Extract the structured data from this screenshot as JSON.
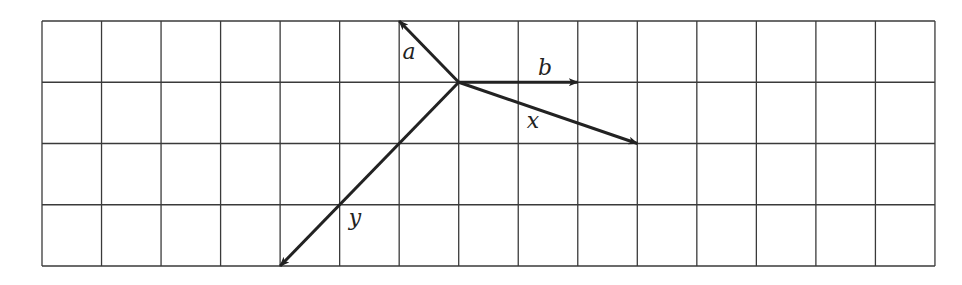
{
  "grid": {
    "cols": 15,
    "rows": 4,
    "left": 42,
    "top": 21,
    "cell_w": 59.53,
    "cell_h": 61.25,
    "line_color": "#3a3a3a"
  },
  "origin": {
    "col": 7,
    "row": 1
  },
  "vectors": [
    {
      "name": "a",
      "label": "a",
      "dx": -1,
      "dy": -1,
      "label_pos": [
        409,
        59
      ]
    },
    {
      "name": "b",
      "label": "b",
      "dx": 2,
      "dy": 0,
      "label_pos": [
        545,
        75
      ]
    },
    {
      "name": "x",
      "label": "x",
      "dx": 3,
      "dy": 1,
      "label_pos": [
        533,
        128
      ]
    },
    {
      "name": "y",
      "label": "y",
      "dx": -3,
      "dy": 3,
      "label_pos": [
        355,
        225
      ]
    }
  ],
  "vector_color": "#222222"
}
